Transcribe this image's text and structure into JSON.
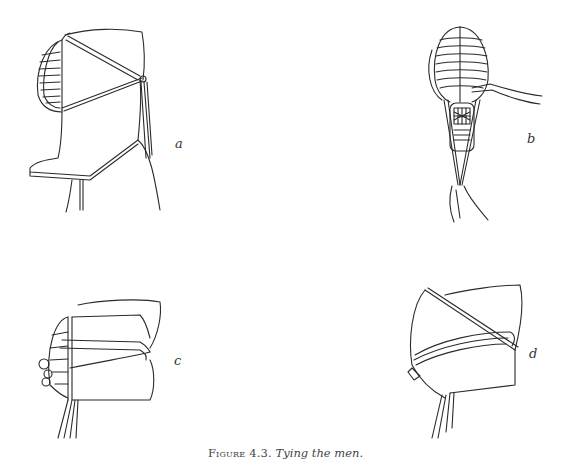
{
  "figure": {
    "caption_prefix": "Figure 4.3.",
    "caption_title": "Tying the men.",
    "panels": [
      {
        "id": "a",
        "label": "a",
        "description": "Side view of kendo men (helmet) with himo cords tied at the back"
      },
      {
        "id": "b",
        "label": "b",
        "description": "Front view of men with cords pulled down by hands"
      },
      {
        "id": "c",
        "label": "c",
        "description": "Men wrapped with cords, side view"
      },
      {
        "id": "d",
        "label": "d",
        "description": "Men folded and wrapped with cords, tied"
      }
    ]
  }
}
